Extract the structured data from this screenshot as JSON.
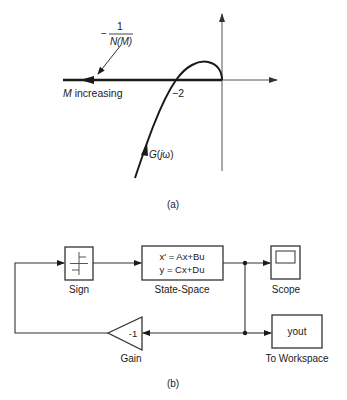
{
  "figure_a": {
    "caption": "(a)",
    "neg_inv_N_numerator": "1",
    "neg_inv_N_minus": "−",
    "neg_inv_N_denominator": "N(M)",
    "m_increasing_M": "M",
    "m_increasing_rest": " increasing",
    "crossing_value": "−2",
    "g_label_G": "G",
    "g_label_paren_open": "(",
    "g_label_j": "j",
    "g_label_omega": "ω",
    "g_label_paren_close": ")"
  },
  "figure_b": {
    "caption": "(b)",
    "blocks": {
      "sign": {
        "label": "Sign"
      },
      "state_space": {
        "label": "State-Space",
        "line1": "x' = Ax+Bu",
        "line2": "y = Cx+Du"
      },
      "scope": {
        "label": "Scope"
      },
      "gain": {
        "label": "Gain",
        "value": "-1"
      },
      "to_workspace": {
        "label": "To Workspace",
        "value": "yout"
      }
    }
  },
  "colors": {
    "line": "#1a1a1a",
    "axis": "#555555",
    "block_border": "#333333"
  }
}
